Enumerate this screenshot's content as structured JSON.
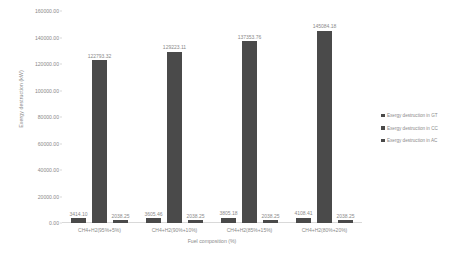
{
  "chart_data": {
    "type": "bar",
    "title": "",
    "xlabel": "Fuel composition (%)",
    "ylabel": "Exergy destruction (kW)",
    "ylim": [
      0,
      160000
    ],
    "ytick_values": [
      160000,
      140000,
      120000,
      100000,
      80000,
      60000,
      40000,
      20000,
      0
    ],
    "ytick_labels": [
      "160000.00",
      "140000.00",
      "120000.00",
      "100000.00",
      "80000.00",
      "60000.00",
      "40000.00",
      "20000.00",
      "0.00"
    ],
    "grid": false,
    "legend_position": "right",
    "bar_color": "#4a4a4a",
    "categories": [
      "CH4+H2(95%+5%)",
      "CH4+H2(90%+10%)",
      "CH4+H2(85%+15%)",
      "CH4+H2(80%+20%)"
    ],
    "series": [
      {
        "name": "Exergy destruction in GT",
        "values": [
          3414.1,
          3605.46,
          3805.18,
          4108.41
        ],
        "labels": [
          "3414.10",
          "3605.46",
          "3805.18",
          "4108.41"
        ]
      },
      {
        "name": "Exergy destruction in CC",
        "values": [
          122793.32,
          129223.11,
          137353.76,
          145084.18
        ],
        "labels": [
          "122793.32",
          "129223.11",
          "137353.76",
          "145084.18"
        ]
      },
      {
        "name": "Exergy destruction in AC",
        "values": [
          2038.25,
          2038.25,
          2038.25,
          2038.25
        ],
        "labels": [
          "2038.25",
          "2038.25",
          "2038.25",
          "2038.25"
        ]
      }
    ]
  }
}
